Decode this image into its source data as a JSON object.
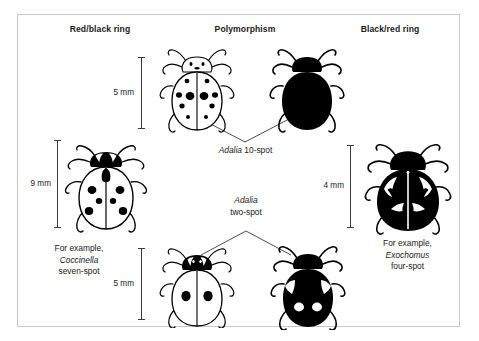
{
  "figure": {
    "background": "#ffffff",
    "border_color": "#c9c9c9",
    "ink_color": "#000000"
  },
  "headers": {
    "left": "Red/black ring",
    "middle": "Polymorphism",
    "right": "Black/red ring"
  },
  "scales": [
    {
      "id": "scale-top-middle",
      "label": "5 mm"
    },
    {
      "id": "scale-left",
      "label": "9 mm"
    },
    {
      "id": "scale-right",
      "label": "4 mm"
    },
    {
      "id": "scale-bottom-middle",
      "label": "5 mm"
    }
  ],
  "morphs": [
    {
      "id": "adalia-10-spot",
      "genus": "Adalia",
      "rest": " 10-spot",
      "forms": [
        "pale-10-spot",
        "melanic-black"
      ]
    },
    {
      "id": "adalia-two-spot",
      "genus": "Adalia",
      "rest": "two-spot",
      "forms": [
        "pale-two-spot",
        "melanic-four-pale-spot"
      ]
    }
  ],
  "examples": {
    "left": {
      "line1": "For example,",
      "species": "Coccinella",
      "line3": "seven-spot"
    },
    "right": {
      "line1": "For example,",
      "species": "Exochomus",
      "line3": "four-spot"
    }
  },
  "beetles": [
    {
      "id": "coccinella-seven-spot",
      "style": "outline",
      "spots": 7,
      "side": "left"
    },
    {
      "id": "adalia-10-spot-pale",
      "style": "outline",
      "spots": 10,
      "side": "middle-top-left"
    },
    {
      "id": "adalia-10-spot-melanic",
      "style": "solid-black",
      "spots": 0,
      "side": "middle-top-right"
    },
    {
      "id": "adalia-two-spot-pale",
      "style": "outline",
      "spots": 2,
      "side": "middle-bottom-left"
    },
    {
      "id": "adalia-two-spot-melanic",
      "style": "solid-black",
      "spots": 4,
      "side": "middle-bottom-right"
    },
    {
      "id": "exochomus-four-spot",
      "style": "solid-black",
      "spots": 4,
      "side": "right"
    }
  ]
}
